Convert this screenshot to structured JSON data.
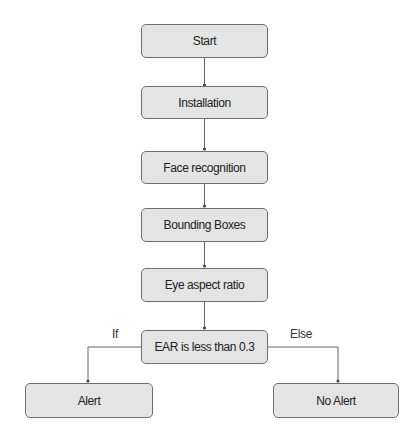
{
  "nodes": {
    "start": "Start",
    "installation": "Installation",
    "face_recognition": "Face recognition",
    "bounding_boxes": "Bounding Boxes",
    "eye_aspect_ratio": "Eye aspect ratio",
    "decision": "EAR is less than 0.3",
    "alert": "Alert",
    "no_alert": "No Alert"
  },
  "edge_labels": {
    "if": "If",
    "else": "Else"
  },
  "colors": {
    "node_fill": "#e4e4e4",
    "node_border": "#6e6e6e",
    "edge": "#666666"
  }
}
